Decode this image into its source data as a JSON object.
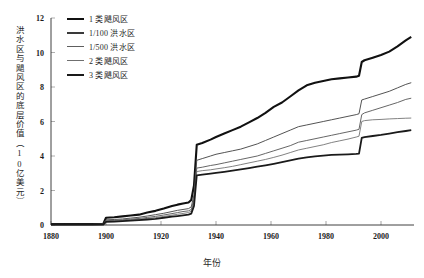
{
  "chart_data": {
    "type": "line",
    "title": "",
    "xlabel": "年份",
    "ylabel": "洪水区与飓风区的底层价值（10亿美元）",
    "xlim": [
      1880,
      2012
    ],
    "ylim": [
      0,
      12
    ],
    "xticks": [
      "1880",
      "1900",
      "1920",
      "1940",
      "1960",
      "1980",
      "2000"
    ],
    "xtick_values": [
      1880,
      1900,
      1920,
      1940,
      1960,
      1980,
      2000
    ],
    "yticks": [
      "0",
      "2",
      "4",
      "6",
      "8",
      "10",
      "12"
    ],
    "ytick_values": [
      0,
      2,
      4,
      6,
      8,
      10,
      12
    ],
    "grid": false,
    "legend_position": "top-left",
    "x": [
      1880,
      1885,
      1890,
      1895,
      1899,
      1900,
      1903,
      1906,
      1909,
      1912,
      1915,
      1918,
      1921,
      1924,
      1926,
      1928,
      1930,
      1931,
      1932,
      1933,
      1935,
      1938,
      1940,
      1943,
      1946,
      1949,
      1952,
      1955,
      1958,
      1961,
      1964,
      1967,
      1970,
      1973,
      1976,
      1979,
      1982,
      1985,
      1988,
      1991,
      1992,
      1993,
      1994,
      1997,
      2000,
      2003,
      2006,
      2009,
      2011
    ],
    "series": [
      {
        "name": "1 类飓风区",
        "color": "#111111",
        "width": 2.1,
        "values": [
          0.05,
          0.05,
          0.05,
          0.05,
          0.06,
          0.42,
          0.45,
          0.5,
          0.55,
          0.6,
          0.72,
          0.82,
          0.95,
          1.1,
          1.18,
          1.25,
          1.3,
          1.45,
          2.3,
          4.65,
          4.75,
          4.95,
          5.1,
          5.3,
          5.5,
          5.7,
          5.95,
          6.2,
          6.5,
          6.85,
          7.1,
          7.45,
          7.8,
          8.1,
          8.25,
          8.35,
          8.45,
          8.5,
          8.55,
          8.6,
          8.65,
          9.45,
          9.55,
          9.7,
          9.85,
          10.05,
          10.35,
          10.7,
          10.9
        ]
      },
      {
        "name": "1/100 洪水区",
        "color": "#4a4a4a",
        "width": 0.95,
        "values": [
          0.04,
          0.04,
          0.04,
          0.04,
          0.05,
          0.3,
          0.32,
          0.35,
          0.4,
          0.45,
          0.52,
          0.6,
          0.68,
          0.78,
          0.85,
          0.9,
          0.95,
          1.05,
          1.75,
          3.75,
          3.85,
          4.0,
          4.1,
          4.2,
          4.3,
          4.4,
          4.55,
          4.7,
          4.9,
          5.1,
          5.3,
          5.5,
          5.7,
          5.8,
          5.9,
          6.0,
          6.1,
          6.2,
          6.3,
          6.4,
          6.45,
          7.25,
          7.3,
          7.45,
          7.6,
          7.75,
          7.95,
          8.15,
          8.25
        ]
      },
      {
        "name": "1/500 洪水区",
        "color": "#5e5e5e",
        "width": 0.95,
        "values": [
          0.03,
          0.03,
          0.03,
          0.03,
          0.04,
          0.25,
          0.27,
          0.3,
          0.34,
          0.38,
          0.44,
          0.5,
          0.58,
          0.66,
          0.72,
          0.78,
          0.82,
          0.9,
          1.5,
          3.3,
          3.35,
          3.45,
          3.5,
          3.6,
          3.7,
          3.8,
          3.9,
          4.0,
          4.15,
          4.3,
          4.45,
          4.6,
          4.8,
          4.9,
          5.0,
          5.1,
          5.2,
          5.3,
          5.4,
          5.5,
          5.55,
          6.4,
          6.5,
          6.65,
          6.8,
          6.95,
          7.1,
          7.28,
          7.35
        ]
      },
      {
        "name": "2 类飓风区",
        "color": "#6b6b6b",
        "width": 0.85,
        "values": [
          0.03,
          0.03,
          0.03,
          0.03,
          0.035,
          0.22,
          0.24,
          0.26,
          0.3,
          0.33,
          0.38,
          0.43,
          0.5,
          0.57,
          0.62,
          0.67,
          0.72,
          0.8,
          1.35,
          3.1,
          3.15,
          3.2,
          3.25,
          3.32,
          3.4,
          3.5,
          3.6,
          3.7,
          3.8,
          3.92,
          4.05,
          4.2,
          4.35,
          4.45,
          4.55,
          4.65,
          4.78,
          4.88,
          4.98,
          5.1,
          5.15,
          6.0,
          6.05,
          6.1,
          6.12,
          6.15,
          6.17,
          6.19,
          6.2
        ]
      },
      {
        "name": "3 类飓风区",
        "color": "#1a1a1a",
        "width": 1.8,
        "values": [
          0.02,
          0.02,
          0.02,
          0.02,
          0.03,
          0.18,
          0.2,
          0.22,
          0.25,
          0.28,
          0.32,
          0.36,
          0.42,
          0.48,
          0.52,
          0.56,
          0.6,
          0.66,
          1.1,
          2.88,
          2.92,
          2.98,
          3.02,
          3.08,
          3.15,
          3.22,
          3.3,
          3.38,
          3.46,
          3.55,
          3.65,
          3.75,
          3.85,
          3.92,
          3.98,
          4.02,
          4.06,
          4.08,
          4.1,
          4.12,
          4.14,
          5.05,
          5.1,
          5.16,
          5.22,
          5.3,
          5.38,
          5.45,
          5.5
        ]
      }
    ]
  },
  "legend": {
    "items": [
      {
        "label": "1 类飓风区",
        "color": "#111111",
        "thickness": "2.6px"
      },
      {
        "label": "1/100 洪水区",
        "color": "#3a3a3a",
        "thickness": "2.2px"
      },
      {
        "label": "1/500 洪水区",
        "color": "#5e5e5e",
        "thickness": "1.8px"
      },
      {
        "label": "2 类飓风区",
        "color": "#6f6f6f",
        "thickness": "1.2px"
      },
      {
        "label": "3 类飓风区",
        "color": "#1a1a1a",
        "thickness": "2.4px"
      }
    ]
  }
}
